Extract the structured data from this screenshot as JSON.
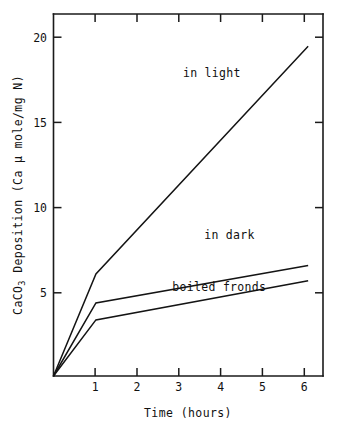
{
  "chart_data": {
    "type": "line",
    "title": "",
    "subtitle": "",
    "xlabel": "Time (hours)",
    "ylabel": "CaCO3 Deposition (Ca μ mole/mg N)",
    "ylabel_parts": {
      "prefix": "CaCO",
      "subscript": "3",
      "suffix": " Deposition (Ca μ mole/mg N)"
    },
    "x": [
      0,
      1,
      6
    ],
    "xlim": [
      0,
      6.35
    ],
    "ylim": [
      0,
      21.3
    ],
    "xticks": [
      1,
      2,
      3,
      4,
      5,
      6
    ],
    "xticklabels": [
      "1",
      "2",
      "3",
      "4",
      "5",
      "6"
    ],
    "yticks": [
      5,
      10,
      15,
      20
    ],
    "yticklabels": [
      "5",
      "10",
      "15",
      "20"
    ],
    "grid": false,
    "legend": "inline-annotations",
    "series": [
      {
        "name": "in light",
        "x": [
          0,
          1,
          6
        ],
        "values": [
          0,
          6.0,
          19.4
        ],
        "label": "in light",
        "label_x": 3.05,
        "label_y": 17.6,
        "color": "#141414"
      },
      {
        "name": "in dark",
        "x": [
          0,
          1,
          6
        ],
        "values": [
          0,
          4.3,
          6.5
        ],
        "label": "in dark",
        "label_x": 3.55,
        "label_y": 8.05,
        "color": "#141414"
      },
      {
        "name": "boiled fronds",
        "x": [
          0,
          1,
          6
        ],
        "values": [
          0,
          3.3,
          5.6
        ],
        "label": "boiled fronds",
        "label_x": 2.8,
        "label_y": 5.0,
        "color": "#141414"
      }
    ],
    "annotations": [
      {
        "text": "in light",
        "x": 3.05,
        "y": 17.6
      },
      {
        "text": "in dark",
        "x": 3.55,
        "y": 8.05
      },
      {
        "text": "boiled fronds",
        "x": 2.8,
        "y": 5.0
      }
    ],
    "axis_color": "#1a1a1a",
    "background": "#ffffff"
  }
}
